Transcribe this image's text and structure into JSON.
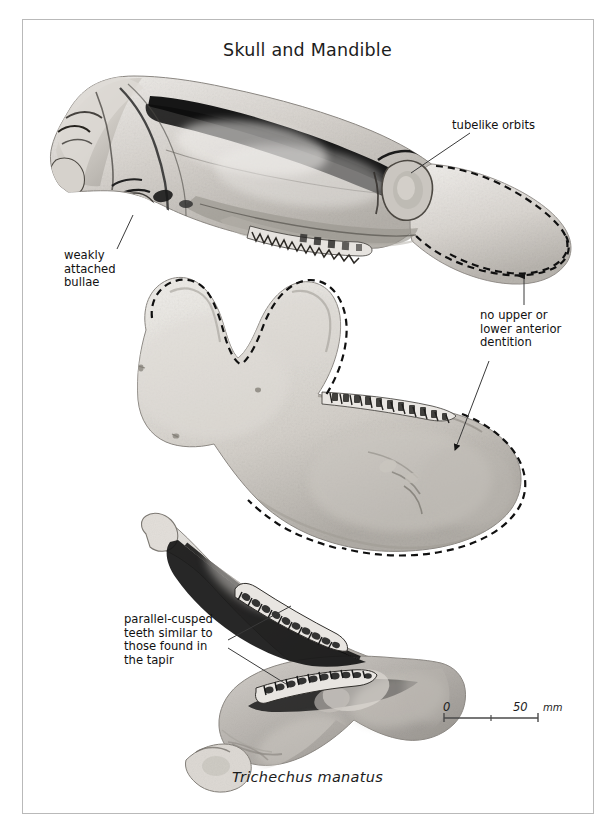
{
  "plate": {
    "title": "Skull and Mandible",
    "species_caption": "Trichechus manatus",
    "background_color": "#ffffff",
    "border_color": "#b9b9b9"
  },
  "annotations": [
    {
      "id": "tubelike-orbits",
      "text": "tubelike orbits",
      "lines": [
        "tubelike orbits"
      ]
    },
    {
      "id": "weakly-attached-bullae",
      "text": "weakly\nattached\nbullae",
      "lines": [
        "weakly",
        "attached",
        "bullae"
      ]
    },
    {
      "id": "no-anterior-dentition",
      "text": "no upper or\nlower anterior\ndentition",
      "lines": [
        "no upper or",
        "lower anterior",
        "dentition"
      ]
    },
    {
      "id": "parallel-cusped-teeth",
      "text": "parallel-cusped\nteeth similar to\nthose found in\nthe tapir",
      "lines": [
        "parallel-cusped",
        "teeth similar to",
        "those found in",
        "the tapir"
      ]
    }
  ],
  "scale_bar": {
    "min_label": "0",
    "max_label": "50",
    "unit_label": "mm",
    "line_color": "#4a4a4a"
  },
  "specimens": [
    {
      "id": "skull-lateral",
      "name": "skull lateral view",
      "features": [
        "tubelike orbits",
        "weakly attached bullae",
        "edentulous rostrum (dashed)",
        "molar tooth row"
      ]
    },
    {
      "id": "mandible-lateral",
      "name": "mandible lateral view",
      "features": [
        "edentulous symphysis (dashed)",
        "molar tooth row"
      ]
    },
    {
      "id": "mandible-occlusal",
      "name": "mandible occlusal view",
      "features": [
        "paired parallel-cusped tooth rows"
      ]
    }
  ],
  "colors": {
    "bone_light": "#e9e7e3",
    "bone_mid": "#cfcbc5",
    "bone_shade": "#a9a5a0",
    "bone_dark": "#6f6b66",
    "suture_dark": "#1a1a1a",
    "dashed_outline": "#141414",
    "leader_line": "#3a3a3a",
    "text": "#111111"
  }
}
